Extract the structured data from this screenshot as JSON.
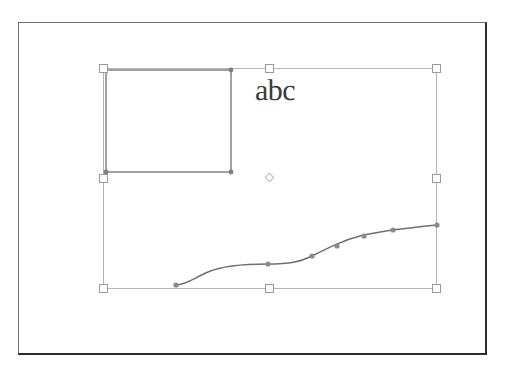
{
  "app": {
    "title": "Vector Drawing Canvas",
    "canvas_background": "#ffffff",
    "frame_color": "#2b2b2b"
  },
  "document_frame": {
    "name": "document-page-border",
    "x": 18,
    "y": 22,
    "width": 469,
    "height": 333
  },
  "selection": {
    "label": "multi-object selection",
    "bounds": {
      "x": 103,
      "y": 68,
      "width": 333,
      "height": 220
    },
    "stroke_color": "#b5b5b5",
    "handle_fill": "#ffffff",
    "handle_stroke": "#9a9a9a",
    "handle_size": 9,
    "handles": [
      {
        "name": "handle-top-left",
        "x": 103,
        "y": 68,
        "cursor": "nwse-resize"
      },
      {
        "name": "handle-top-center",
        "x": 269,
        "y": 68,
        "cursor": "ns-resize"
      },
      {
        "name": "handle-top-right",
        "x": 436,
        "y": 68,
        "cursor": "nesw-resize"
      },
      {
        "name": "handle-middle-left",
        "x": 103,
        "y": 178,
        "cursor": "ew-resize"
      },
      {
        "name": "handle-middle-right",
        "x": 436,
        "y": 178,
        "cursor": "ew-resize"
      },
      {
        "name": "handle-bottom-left",
        "x": 103,
        "y": 288,
        "cursor": "nesw-resize"
      },
      {
        "name": "handle-bottom-center",
        "x": 269,
        "y": 288,
        "cursor": "ns-resize"
      },
      {
        "name": "handle-bottom-right",
        "x": 436,
        "y": 288,
        "cursor": "nwse-resize"
      }
    ],
    "rotation_center": {
      "name": "rotation-center-marker",
      "x": 270,
      "y": 178
    }
  },
  "objects": [
    {
      "type": "rectangle",
      "name": "rectangle-shape",
      "x": 106,
      "y": 70,
      "width": 125,
      "height": 102,
      "stroke": "#8b8b8b",
      "stroke_width": 1.6,
      "fill": "none",
      "node_color": "#7d7d7d",
      "nodes": [
        {
          "x": 231,
          "y": 70
        },
        {
          "x": 231,
          "y": 172
        },
        {
          "x": 106,
          "y": 172
        }
      ]
    },
    {
      "type": "text",
      "name": "text-object",
      "value": "abc",
      "x": 255,
      "y": 76,
      "font_size": 30,
      "color": "#3b3b3b"
    },
    {
      "type": "spline",
      "name": "curve-path",
      "stroke": "#6f6f6f",
      "stroke_width": 1.5,
      "fill": "none",
      "path": "M 176 285 C 186 285 196 277 208 272 C 224 265 246 264 268 264 C 290 264 300 262 312 256 C 330 247 344 240 360 236 C 380 231 406 228 437 225",
      "node_color": "#8a8a8a",
      "nodes": [
        {
          "x": 176,
          "y": 285
        },
        {
          "x": 268,
          "y": 264
        },
        {
          "x": 312,
          "y": 256
        },
        {
          "x": 337,
          "y": 246
        },
        {
          "x": 364,
          "y": 236
        },
        {
          "x": 393,
          "y": 230
        },
        {
          "x": 437,
          "y": 225
        }
      ]
    }
  ],
  "chart_data": null
}
